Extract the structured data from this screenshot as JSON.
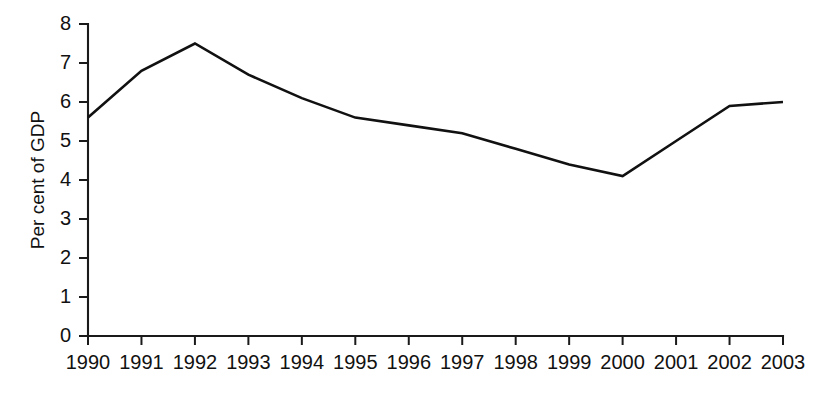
{
  "chart_data": {
    "type": "line",
    "title": "",
    "subtitle": "",
    "xlabel": "",
    "ylabel": "Per cent of GDP",
    "categories": [
      "1990",
      "1991",
      "1992",
      "1993",
      "1994",
      "1995",
      "1996",
      "1997",
      "1998",
      "1999",
      "2000",
      "2001",
      "2002",
      "2003"
    ],
    "values": [
      5.6,
      6.8,
      7.5,
      6.7,
      6.1,
      5.6,
      5.4,
      5.2,
      4.8,
      4.4,
      4.1,
      5.0,
      5.9,
      6.0
    ],
    "ylim": [
      0,
      8
    ],
    "ytick_labels": [
      "0",
      "1",
      "2",
      "3",
      "4",
      "5",
      "6",
      "7",
      "8"
    ],
    "ytick_values": [
      0,
      1,
      2,
      3,
      4,
      5,
      6,
      7,
      8
    ],
    "grid": false,
    "legend": false,
    "legend_position": "none",
    "line_color": "#111111",
    "axis_color": "#1a1a1a",
    "background_color": "#ffffff"
  }
}
